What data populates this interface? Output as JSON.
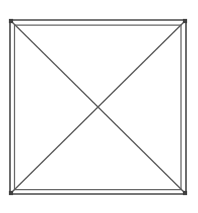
{
  "figure": {
    "kind": "line-drawing",
    "background_color": "#ffffff",
    "line_color": "#4a4a4a",
    "inner_line_color": "#676767",
    "diagonal_color": "#5a5a5a",
    "canvas": {
      "width": 198,
      "height": 213
    },
    "outer_square": {
      "name": "outer-square",
      "top_left": [
        10,
        20
      ],
      "top_right": [
        186,
        20
      ],
      "bottom_right": [
        186,
        194
      ],
      "bottom_left": [
        10,
        194
      ],
      "width": 176,
      "height": 174
    },
    "inner_square": {
      "name": "inner-square",
      "top_left": [
        14.5,
        25
      ],
      "top_right": [
        181,
        25
      ],
      "bottom_right": [
        181,
        189.5
      ],
      "bottom_left": [
        14.5,
        189.5
      ],
      "width": 166.5,
      "height": 164.5
    },
    "center_point": [
      98,
      107
    ],
    "diagonals": [
      {
        "name": "diagonal-tl-br",
        "from": [
          11,
          21
        ],
        "to": [
          185,
          193
        ]
      },
      {
        "name": "diagonal-tr-bl",
        "from": [
          185,
          21
        ],
        "to": [
          11,
          193
        ]
      }
    ],
    "corner_markers": [
      {
        "name": "corner-marker-top-left",
        "at": [
          11,
          21
        ]
      },
      {
        "name": "corner-marker-top-right",
        "at": [
          185,
          21
        ]
      },
      {
        "name": "corner-marker-bottom-right",
        "at": [
          185,
          193
        ]
      },
      {
        "name": "corner-marker-bottom-left",
        "at": [
          11,
          193
        ]
      }
    ],
    "labels": []
  }
}
